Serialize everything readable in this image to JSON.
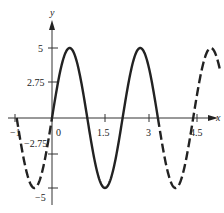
{
  "chart_data": {
    "type": "line",
    "title": "",
    "function": "y = 5 sin(pi x)",
    "xlabel": "x",
    "ylabel": "y",
    "x_ticks": [
      "-1",
      "0",
      "1.5",
      "3",
      "4.5"
    ],
    "y_ticks": [
      "5",
      "2.75",
      "-2.75",
      "-5"
    ],
    "xlim": [
      -1,
      4.7
    ],
    "ylim": [
      -5,
      5
    ],
    "grid": false,
    "series": [
      {
        "name": "solid segment",
        "style": "solid",
        "x_range": [
          0,
          3
        ]
      },
      {
        "name": "dashed left",
        "style": "dashed",
        "x_range": [
          -1,
          0
        ]
      },
      {
        "name": "dashed right",
        "style": "dashed",
        "x_range": [
          3,
          4.75
        ]
      }
    ]
  },
  "labels": {
    "x_axis": "x",
    "y_axis": "y",
    "x_neg1": "−1",
    "x_0": "0",
    "x_1_5": "1.5",
    "x_3": "3",
    "x_4_5": "4.5",
    "y_5": "5",
    "y_2_75": "2.75",
    "y_neg2_75": "−2.75",
    "y_neg5": "−5"
  }
}
